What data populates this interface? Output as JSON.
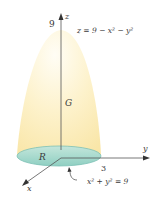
{
  "figure": {
    "z_axis_label": "z",
    "y_axis_label": "y",
    "x_axis_label": "x",
    "z_tick_label": "9",
    "y_tick_label": "3",
    "surface_equation": "z = 9 − x² − y²",
    "region_G_label": "G",
    "region_R_label": "R",
    "boundary_equation": "x² + y² = 9",
    "colors": {
      "solid_fill": "#fbeec0",
      "solid_fill_light": "#fffaf0",
      "base_fill": "#a8d8cc",
      "base_stroke": "#7cc0b5",
      "axis": "#555555",
      "text": "#3a3a3a"
    }
  }
}
